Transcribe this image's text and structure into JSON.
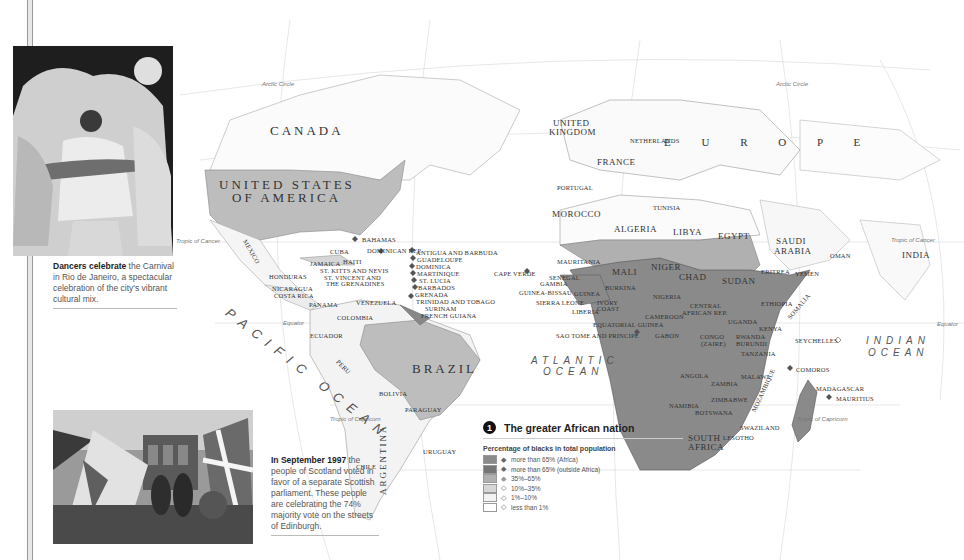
{
  "colors": {
    "africa_high": "#8a8a8a",
    "outside_high": "#767676",
    "mid": "#b0b0b0",
    "low": "#d6d6d6",
    "very_low": "#f2f2f2",
    "none": "#ffffff"
  },
  "photos": [
    {
      "name": "rio-carnival-photo"
    },
    {
      "name": "edinburgh-photo"
    }
  ],
  "captions": {
    "rio": {
      "bold": "Dancers celebrate",
      "text": " the Carnival in Rio de Janeiro, a spectacular celebration of the city's vibrant cultural mix."
    },
    "scotland": {
      "bold": "In September 1997",
      "text": " the people of Scotland voted in favor of a separate Scottish parliament. These people are celebrating the 74% majority vote on the streets of Edinburgh."
    }
  },
  "map": {
    "lines": {
      "arctic1": "Arctic Circle",
      "arctic2": "Arctic Circle",
      "cancer1": "Tropic of Cancer",
      "cancer2": "Tropic of Cancer",
      "equator1": "Equator",
      "equator2": "Equator",
      "capricorn1": "Tropic of Capricorn",
      "capricorn2": "Tropic of Capricorn"
    },
    "oceans": {
      "pacific": "PACIFIC OCEAN",
      "atlantic1": "ATLANTIC",
      "atlantic2": "OCEAN",
      "indian1": "INDIAN",
      "indian2": "OCEAN"
    },
    "regions": {
      "europe": "E U R O P E"
    },
    "countries": {
      "canada": "CANADA",
      "usa1": "UNITED STATES",
      "usa2": "OF AMERICA",
      "mexico": "MEXICO",
      "brazil": "BRAZIL",
      "bahamas": "BAHAMAS",
      "cuba": "CUBA",
      "dominican": "DOMINICAN REP.",
      "haiti": "HAITI",
      "jamaica": "JAMAICA",
      "stkitts": "ST. KITTS AND NEVIS",
      "stvincent1": "ST. VINCENT AND",
      "stvincent2": "THE GRENADINES",
      "honduras": "HONDURAS",
      "nicaragua": "NICARAGUA",
      "costarica": "COSTA RICA",
      "panama": "PANAMA",
      "venezuela": "VENEZUELA",
      "colombia": "COLOMBIA",
      "ecuador": "ECUADOR",
      "peru": "PERU",
      "bolivia": "BOLIVIA",
      "paraguay": "PARAGUAY",
      "chile": "CHILE",
      "argentina": "ARGENTINA",
      "uruguay": "URUGUAY",
      "guyana": "GUYANA",
      "antigua": "ANTIGUA AND BARBUDA",
      "guadeloupe": "GUADELOUPE",
      "dominica": "DOMINICA",
      "martinique": "MARTINIQUE",
      "stlucia": "ST. LUCIA",
      "barbados": "BARBADOS",
      "grenada": "GRENADA",
      "trinidad": "TRINIDAD AND TOBAGO",
      "surinam": "SURINAM",
      "frguiana": "FRENCH GUIANA",
      "uk1": "UNITED",
      "uk2": "KINGDOM",
      "netherlands": "NETHERLANDS",
      "france": "FRANCE",
      "portugal": "PORTUGAL",
      "morocco": "MOROCCO",
      "tunisia": "TUNISIA",
      "algeria": "ALGERIA",
      "libya": "LIBYA",
      "egypt": "EGYPT",
      "saudi1": "SAUDI",
      "saudi2": "ARABIA",
      "oman": "OMAN",
      "yemen": "YEMEN",
      "india": "INDIA",
      "mauritania": "MAURITANIA",
      "mali": "MALI",
      "niger": "NIGER",
      "chad": "CHAD",
      "sudan": "SUDAN",
      "eritrea": "ERITREA",
      "ethiopia": "ETHIOPIA",
      "somalia": "SOMALIA",
      "djibouti": "DJIBOUTI",
      "capeverde": "CAPE VERDE",
      "senegal": "SENEGAL",
      "gambia": "GAMBIA",
      "guineabissau": "GUINEA-BISSAU",
      "guinea": "GUINEA",
      "sierraleone": "SIERRA LEONE",
      "liberia": "LIBERIA",
      "ivory1": "IVORY",
      "ivory2": "COAST",
      "burkina": "BURKINA",
      "ghana": "GHANA",
      "togo": "TOGO",
      "benin": "BENIN",
      "nigeria": "NIGERIA",
      "cameroon": "CAMEROON",
      "car1": "CENTRAL",
      "car2": "AFRICAN REP.",
      "eqguinea": "EQUATORIAL GUINEA",
      "saotome": "SAO TOME AND PRINCIPE",
      "gabon": "GABON",
      "congo": "CONGO",
      "congo1": "CONGO",
      "congo2": "(ZAIRE)",
      "uganda": "UGANDA",
      "kenya": "KENYA",
      "rwanda": "RWANDA",
      "burundi": "BURUNDI",
      "tanzania": "TANZANIA",
      "angola": "ANGOLA",
      "zambia": "ZAMBIA",
      "malawi": "MALAWI",
      "mozambique": "MOZAMBIQUE",
      "zimbabwe": "ZIMBABWE",
      "namibia": "NAMIBIA",
      "botswana": "BOTSWANA",
      "swaziland": "SWAZILAND",
      "lesotho": "LESOTHO",
      "southafrica1": "SOUTH",
      "southafrica2": "AFRICA",
      "seychelles": "SEYCHELLES",
      "comoros": "COMOROS",
      "madagascar": "MADAGASCAR",
      "mauritius": "MAURITIUS"
    }
  },
  "legend": {
    "number": "1",
    "title": "The greater African nation",
    "subtitle": "Percentage of blacks in total population",
    "items": [
      {
        "label": "more than 65% (Africa)",
        "color": "#8a8a8a"
      },
      {
        "label": "more than 65% (outside Africa)",
        "color": "#767676"
      },
      {
        "label": "35%–65%",
        "color": "#b0b0b0"
      },
      {
        "label": "10%–35%",
        "color": "#d6d6d6"
      },
      {
        "label": "1%–10%",
        "color": "#f2f2f2"
      },
      {
        "label": "less than 1%",
        "color": "#ffffff"
      }
    ]
  }
}
